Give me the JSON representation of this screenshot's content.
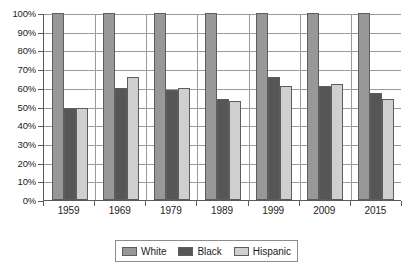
{
  "chart_data": {
    "type": "bar",
    "title": "",
    "subtitle": "",
    "xlabel": "",
    "ylabel": "",
    "ylim": [
      0,
      100
    ],
    "grid": true,
    "legend_position": "bottom",
    "categories": [
      "1959",
      "1969",
      "1979",
      "1989",
      "1999",
      "2009",
      "2015"
    ],
    "y_ticks": [
      "0%",
      "10%",
      "20%",
      "30%",
      "40%",
      "50%",
      "60%",
      "70%",
      "80%",
      "90%",
      "100%"
    ],
    "y_tick_values": [
      0,
      10,
      20,
      30,
      40,
      50,
      60,
      70,
      80,
      90,
      100
    ],
    "series": [
      {
        "name": "White",
        "color": "#989898",
        "values": [
          100,
          100,
          100,
          100,
          100,
          100,
          100
        ]
      },
      {
        "name": "Black",
        "color": "#565656",
        "values": [
          49,
          60,
          59,
          54,
          66,
          61,
          57
        ]
      },
      {
        "name": "Hispanic",
        "color": "#cfcfcf",
        "values": [
          49,
          66,
          60,
          53,
          61,
          62,
          54
        ]
      }
    ]
  },
  "legend": {
    "items": [
      {
        "label": "White"
      },
      {
        "label": "Black"
      },
      {
        "label": "Hispanic"
      }
    ]
  }
}
